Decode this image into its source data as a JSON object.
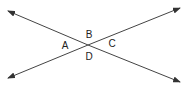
{
  "diagram": {
    "type": "intersecting-lines",
    "lines": [
      {
        "name": "line-1",
        "from": [
          8,
          11
        ],
        "to": [
          180,
          82
        ]
      },
      {
        "name": "line-2",
        "from": [
          8,
          78
        ],
        "to": [
          180,
          8
        ]
      }
    ],
    "intersection": [
      88,
      45
    ],
    "labels": [
      {
        "text": "B",
        "x": 89,
        "y": 35
      },
      {
        "text": "A",
        "x": 65,
        "y": 46
      },
      {
        "text": "C",
        "x": 112,
        "y": 44
      },
      {
        "text": "D",
        "x": 89,
        "y": 57
      }
    ],
    "stroke_color": "#333333"
  }
}
